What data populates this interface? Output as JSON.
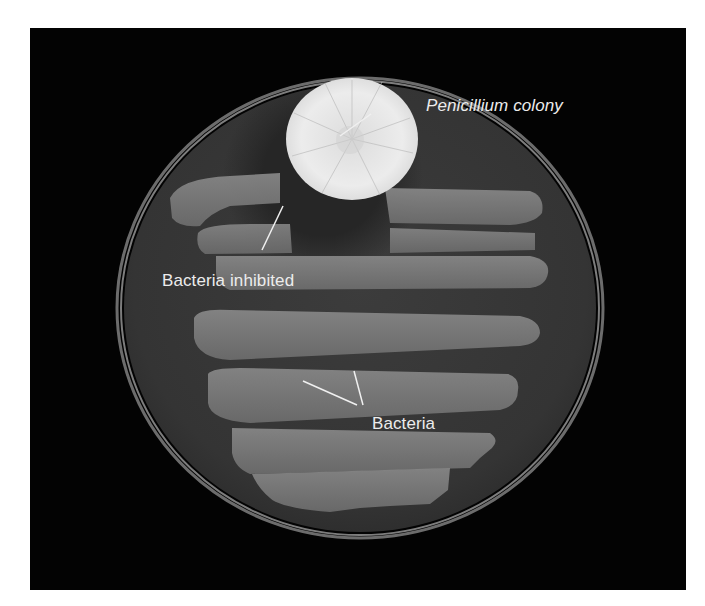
{
  "figure": {
    "labels": {
      "penicillium": "Penicillium colony",
      "inhibited": "Bacteria inhibited",
      "bacteria": "Bacteria"
    },
    "colors": {
      "background": "#030303",
      "agar": "#3a3a3a",
      "bacteria_streak": "#7a7a7a",
      "colony": "#e6e6e6",
      "label_text": "#ececec"
    }
  }
}
